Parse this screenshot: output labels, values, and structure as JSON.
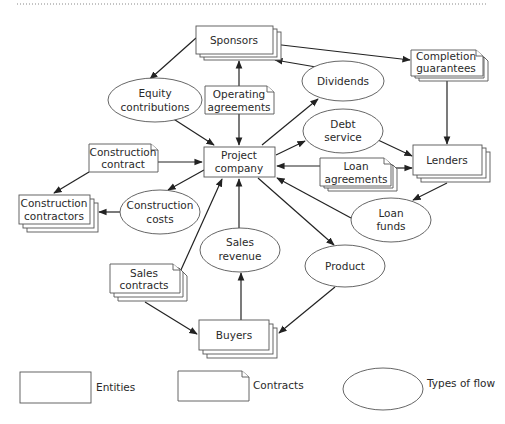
{
  "diagram": {
    "type": "project-finance-structure",
    "entities": [
      {
        "id": "sponsors",
        "lines": [
          "Sponsors"
        ]
      },
      {
        "id": "project",
        "lines": [
          "Project",
          "company"
        ]
      },
      {
        "id": "lenders",
        "lines": [
          "Lenders"
        ]
      },
      {
        "id": "contractors",
        "lines": [
          "Construction",
          "contractors"
        ]
      },
      {
        "id": "buyers",
        "lines": [
          "Buyers"
        ]
      }
    ],
    "contracts": [
      {
        "id": "completion",
        "lines": [
          "Completion",
          "guarantees"
        ]
      },
      {
        "id": "operating",
        "lines": [
          "Operating",
          "agreements"
        ]
      },
      {
        "id": "construction_contract",
        "lines": [
          "Construction",
          "contract"
        ]
      },
      {
        "id": "loan_agreements",
        "lines": [
          "Loan",
          "agreements"
        ]
      },
      {
        "id": "sales_contracts",
        "lines": [
          "Sales",
          "contracts"
        ]
      }
    ],
    "flows": [
      {
        "id": "equity",
        "lines": [
          "Equity",
          "contributions"
        ]
      },
      {
        "id": "dividends",
        "lines": [
          "Dividends"
        ]
      },
      {
        "id": "debt_service",
        "lines": [
          "Debt",
          "service"
        ]
      },
      {
        "id": "construction_costs",
        "lines": [
          "Construction",
          "costs"
        ]
      },
      {
        "id": "loan_funds",
        "lines": [
          "Loan",
          "funds"
        ]
      },
      {
        "id": "sales_revenue",
        "lines": [
          "Sales",
          "revenue"
        ]
      },
      {
        "id": "product",
        "lines": [
          "Product"
        ]
      }
    ],
    "edges": [
      {
        "from": "sponsors",
        "to": "equity"
      },
      {
        "from": "equity",
        "to": "project"
      },
      {
        "from": "sponsors",
        "to": "completion"
      },
      {
        "from": "dividends",
        "to": "sponsors"
      },
      {
        "from": "project",
        "to": "dividends"
      },
      {
        "from": "operating",
        "to": "sponsors"
      },
      {
        "from": "operating",
        "to": "project"
      },
      {
        "from": "completion",
        "to": "lenders"
      },
      {
        "from": "project",
        "to": "debt_service"
      },
      {
        "from": "debt_service",
        "to": "lenders"
      },
      {
        "from": "loan_agreements",
        "to": "project"
      },
      {
        "from": "loan_agreements",
        "to": "lenders"
      },
      {
        "from": "lenders",
        "to": "loan_funds"
      },
      {
        "from": "loan_funds",
        "to": "project"
      },
      {
        "from": "construction_contract",
        "to": "project"
      },
      {
        "from": "construction_contract",
        "to": "contractors"
      },
      {
        "from": "project",
        "to": "construction_costs"
      },
      {
        "from": "construction_costs",
        "to": "contractors"
      },
      {
        "from": "sales_contracts",
        "to": "project"
      },
      {
        "from": "sales_contracts",
        "to": "buyers"
      },
      {
        "from": "buyers",
        "to": "sales_revenue"
      },
      {
        "from": "sales_revenue",
        "to": "project"
      },
      {
        "from": "project",
        "to": "product"
      },
      {
        "from": "product",
        "to": "buyers"
      }
    ]
  },
  "labels": {
    "sponsors": "Sponsors",
    "completion_1": "Completion",
    "completion_2": "guarantees",
    "dividends": "Dividends",
    "equity_1": "Equity",
    "equity_2": "contributions",
    "operating_1": "Operating",
    "operating_2": "agreements",
    "debt_1": "Debt",
    "debt_2": "service",
    "project_1": "Project",
    "project_2": "company",
    "cc_1": "Construction",
    "cc_2": "contract",
    "lenders": "Lenders",
    "loanag_1": "Loan",
    "loanag_2": "agreements",
    "contractors_1": "Construction",
    "contractors_2": "contractors",
    "costs_1": "Construction",
    "costs_2": "costs",
    "loanfunds_1": "Loan",
    "loanfunds_2": "funds",
    "salesrev_1": "Sales",
    "salesrev_2": "revenue",
    "product": "Product",
    "salescon_1": "Sales",
    "salescon_2": "contracts",
    "buyers": "Buyers"
  },
  "legend": {
    "entities": "Entities",
    "contracts": "Contracts",
    "flows": "Types of flow"
  }
}
